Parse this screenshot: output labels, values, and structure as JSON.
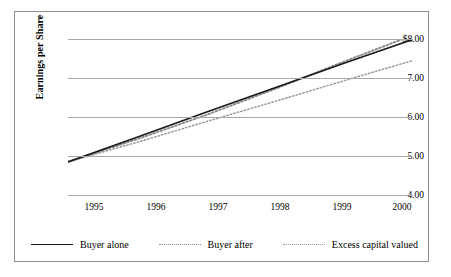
{
  "chart_data": {
    "type": "line",
    "title": "",
    "xlabel": "",
    "ylabel": "Earnings per Share",
    "x": [
      1995,
      1996,
      1997,
      1998,
      1999,
      2000
    ],
    "categories": [
      "1995",
      "1996",
      "1997",
      "1998",
      "1999",
      "2000"
    ],
    "xlim": [
      1995,
      2000
    ],
    "ylim": [
      4.0,
      8.0
    ],
    "y_ticks": [
      4.0,
      5.0,
      6.0,
      7.0,
      8.0
    ],
    "y_tick_labels": [
      "4.00",
      "5.00",
      "6.00",
      "7.00",
      "$8.00"
    ],
    "x_tick_labels": [
      "1995",
      "1996",
      "1997",
      "1998",
      "1999",
      "2000"
    ],
    "grid": true,
    "grid_axis": "y",
    "legend_position": "bottom",
    "series": [
      {
        "name": "Buyer alone",
        "style": "solid",
        "color": "#1a1a1a",
        "values": [
          4.85,
          5.48,
          6.12,
          6.75,
          7.38,
          7.99
        ]
      },
      {
        "name": "Buyer after",
        "style": "dotted",
        "color": "#8a8a8a",
        "values": [
          4.85,
          5.43,
          6.05,
          6.72,
          7.42,
          8.1
        ]
      },
      {
        "name": "Excess capital valued",
        "style": "dotted",
        "color": "#9b9b9b",
        "values": [
          4.85,
          5.35,
          5.88,
          6.4,
          6.93,
          7.45
        ]
      }
    ]
  },
  "axis": {
    "y_title": "Earnings per Share"
  },
  "legend": {
    "entries": [
      {
        "label": "Buyer alone"
      },
      {
        "label": "Buyer after"
      },
      {
        "label": "Excess capital valued"
      }
    ]
  }
}
